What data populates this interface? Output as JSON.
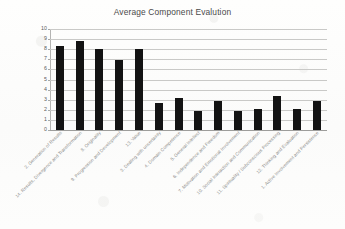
{
  "chart_data": {
    "type": "bar",
    "title": "Average Component Evalution",
    "xlabel": "",
    "ylabel": "",
    "ylim": [
      0,
      10
    ],
    "ytick_step": 1,
    "grid": true,
    "legend": "none",
    "orientation": "vertical",
    "bar_color": "#131313",
    "gridline_color": "#c9c9c7",
    "background_color": "#fdfdfc",
    "label_rotation_degrees": -45,
    "ytick_labels": [
      "10",
      "9",
      "8",
      "7",
      "6",
      "5",
      "4",
      "3",
      "2",
      "1",
      "0"
    ],
    "categories": [
      "2. Generation of Results",
      "14. Results, Divergence and Transformation",
      "8. Originality",
      "9. Progression and Development",
      "13. Value",
      "3. Dealing with uncertainty",
      "4. Domain Competence",
      "5. General Intellect",
      "6. Independence and Freedom",
      "7. Motivation and Emotional Involvement",
      "10. Social Interaction and Communication",
      "11. Spirituality / Subconscious Processing",
      "12. Thinking and Evaluation",
      "1. Active Involvement and Persistence"
    ],
    "values": [
      8.3,
      8.8,
      8.05,
      6.9,
      8.05,
      2.7,
      3.2,
      1.85,
      2.85,
      1.85,
      2.05,
      3.4,
      2.1,
      2.85
    ]
  }
}
